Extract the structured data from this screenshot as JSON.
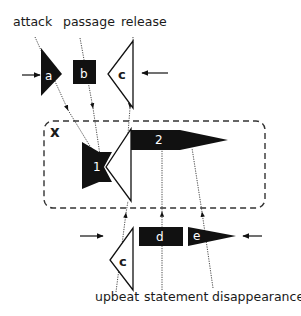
{
  "diagram": {
    "top_labels": {
      "attack": "attack",
      "passage": "passage",
      "release": "release"
    },
    "bottom_labels": {
      "upbeat": "upbeat",
      "statement": "statement",
      "disappearance": "disappearance"
    },
    "group_label": "x",
    "shapes": {
      "a": "a",
      "b": "b",
      "c_top": "c",
      "one": "1",
      "two": "2",
      "c_bottom": "c",
      "d": "d",
      "e": "e"
    },
    "colors": {
      "ink": "#111111",
      "background": "#ffffff",
      "dashed_box": "#333333"
    }
  }
}
